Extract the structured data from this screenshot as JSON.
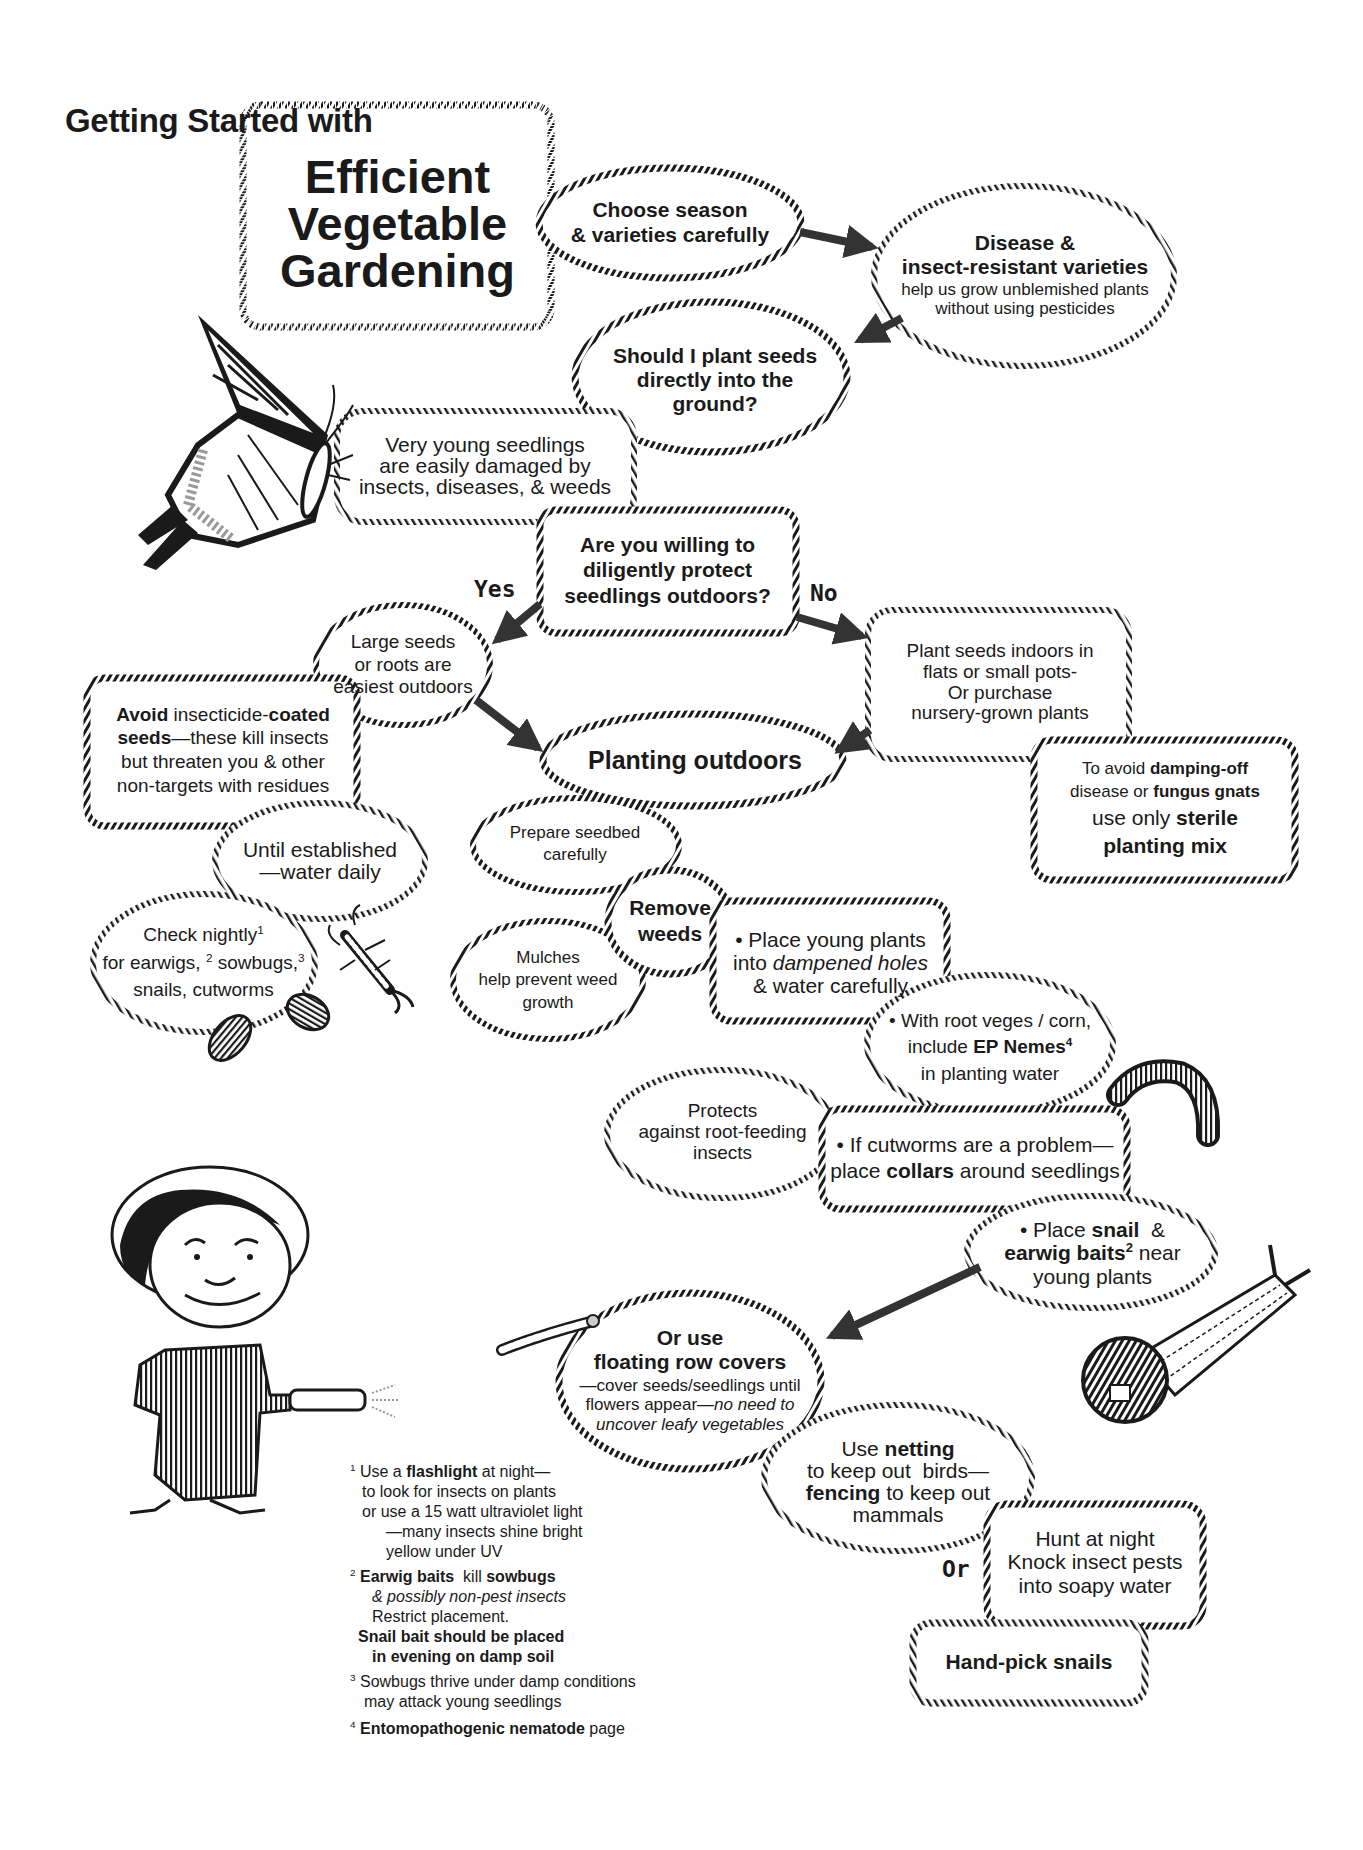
{
  "header": {
    "subtitle": "Getting Started with",
    "title_lines": [
      "Efficient",
      "Vegetable",
      "Gardening"
    ]
  },
  "flow": {
    "choose_season": [
      "Choose season",
      "& varieties carefully"
    ],
    "disease_resistant": {
      "bold_lines": [
        "Disease &",
        "insect-resistant varieties"
      ],
      "lines": [
        "help us grow unblemished plants",
        "without using pesticides"
      ]
    },
    "should_plant": [
      "Should I plant seeds",
      "directly into the",
      "ground?"
    ],
    "very_young": [
      "Very young seedlings",
      "are easily damaged by",
      "insects, diseases, & weeds"
    ],
    "willing": [
      "Are you willing to",
      "diligently protect",
      "seedlings outdoors?"
    ],
    "yes_label": "Yes",
    "no_label": "No",
    "large_seeds": [
      "Large seeds",
      "or roots are",
      "easiest outdoors"
    ],
    "avoid": {
      "line1_bold_a": "Avoid",
      "line1_mid": " insecticide-",
      "line1_bold_b": "coated",
      "line2_bold": "seeds",
      "line2_rest": "—these kill insects",
      "line3": "but threaten you & other",
      "line4": "non-targets with residues"
    },
    "indoors": [
      "Plant seeds indoors in",
      "flats or small pots-",
      "Or purchase",
      "nursery-grown plants"
    ],
    "planting_outdoors": "Planting outdoors",
    "damping": {
      "l1_pre": "To avoid ",
      "l1_bold": "damping-off",
      "l2_pre": "disease or ",
      "l2_bold": "fungus gnats",
      "l3_pre": "use only ",
      "l3_bold": "sterile",
      "l4_bold": "planting mix"
    },
    "until_established": [
      "Until established",
      "—water daily"
    ],
    "prepare_seedbed": [
      "Prepare seedbed",
      "carefully"
    ],
    "check_nightly": {
      "l1": "Check nightly",
      "sup1": "1",
      "l2a": "for earwigs,",
      "sup2": "2",
      "l2b": " sowbugs,",
      "sup3": "3",
      "l3": "snails, cutworms"
    },
    "remove_weeds": [
      "Remove",
      "weeds"
    ],
    "mulches": [
      "Mulches",
      "help prevent weed",
      "growth"
    ],
    "place_young": {
      "l1": "• Place young plants",
      "l2_pre": "into ",
      "l2_italic": "dampened holes",
      "l3": "& water carefully"
    },
    "root_veges": {
      "l1": "• With root veges / corn,",
      "l2_pre": "include ",
      "l2_bold": "EP Nemes",
      "sup": "4",
      "l3": "in planting water"
    },
    "protects": [
      "Protects",
      "against root-feeding",
      "insects"
    ],
    "cutworms": {
      "l1": "• If cutworms are a problem—",
      "l2_pre": "place ",
      "l2_bold": "collars",
      "l2_post": " around seedlings"
    },
    "place_snail": {
      "l1_pre": "• Place ",
      "l1_bold": "snail",
      "l1_post": "  &",
      "l2_bold": "earwig baits",
      "sup": "2",
      "l2_post": " near",
      "l3": "young plants"
    },
    "row_covers": {
      "bold_lines": [
        "Or use",
        "floating row covers"
      ],
      "l3": "—cover seeds/seedlings until",
      "l4_pre": "flowers appear—",
      "l4_italic": "no need to",
      "l5_italic": "uncover leafy vegetables"
    },
    "netting": {
      "l1_pre": "Use ",
      "l1_bold": "netting",
      "l2": "to keep out  birds—",
      "l3_bold": "fencing",
      "l3_post": " to keep out",
      "l4": "mammals"
    },
    "or_label": "Or",
    "hunt": [
      "Hunt at night",
      "Knock insect pests",
      "into soapy water"
    ],
    "hand_pick": "Hand-pick snails"
  },
  "footnotes": [
    {
      "num": "1",
      "lines": [
        {
          "pre": "Use a ",
          "bold": "flashlight",
          "post": " at night—"
        },
        {
          "pre": "to look for insects on plants"
        },
        {
          "pre": "or use a 15 watt ultraviolet light"
        },
        {
          "pre": "—many insects shine bright",
          "indent": 2
        },
        {
          "pre": "yellow under UV",
          "indent": 2
        }
      ]
    },
    {
      "num": "2",
      "lines": [
        {
          "bold": "Earwig baits",
          "post": "  kill "
        },
        {
          "italic": "& possibly non-pest insects"
        },
        {
          "pre": "Restrict placement."
        },
        {
          "bold": "Snail bait should be placed"
        },
        {
          "bold": "in evening on damp soil"
        }
      ],
      "bold_tail": "sowbugs"
    },
    {
      "num": "3",
      "lines": [
        {
          "pre": "Sowbugs thrive under damp conditions"
        },
        {
          "pre": "may attack young seedlings"
        }
      ]
    },
    {
      "num": "4",
      "lines": [
        {
          "bold": "Entomopathogenic nematode",
          "post": " page"
        }
      ]
    }
  ],
  "illustrations": [
    "butterfly-icon",
    "boy-with-flashlight-icon",
    "earwig-icon",
    "sowbug-icon",
    "cutworm-icon",
    "snail-icon",
    "caterpillar-icon"
  ],
  "colors": {
    "ink": "#1a1a1a",
    "arrow": "#333333",
    "background": "#ffffff"
  }
}
